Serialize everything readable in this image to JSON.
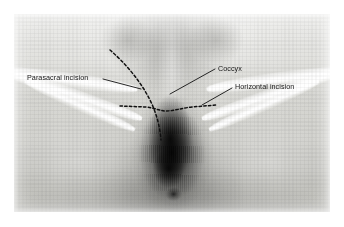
{
  "figure": {
    "type": "clinical-photograph",
    "modality": "grayscale photograph",
    "plate": {
      "left": 14,
      "top": 14,
      "width": 316,
      "height": 198,
      "background_color": "#c9c9c7"
    },
    "page_background": "#ffffff"
  },
  "annotations": {
    "labels": [
      {
        "id": "parasacral",
        "text": "Parasacral incision",
        "x": 27,
        "y": 74,
        "anchor": "left",
        "color": "#151515"
      },
      {
        "id": "coccyx",
        "text": "Coccyx",
        "x": 218,
        "y": 65,
        "anchor": "left",
        "color": "#151515"
      },
      {
        "id": "horizontal",
        "text": "Horizontal incision",
        "x": 235,
        "y": 83,
        "anchor": "left",
        "color": "#151515"
      }
    ],
    "leaders": [
      {
        "id": "leader-parasacral",
        "for": "parasacral",
        "from_x": 103,
        "from_y": 79,
        "to_x": 141,
        "to_y": 89,
        "color": "#111111",
        "width": 0.9
      },
      {
        "id": "leader-coccyx",
        "for": "coccyx",
        "from_x": 215,
        "from_y": 69,
        "to_x": 170,
        "to_y": 94,
        "color": "#111111",
        "width": 0.9
      },
      {
        "id": "leader-horizontal",
        "for": "horizontal",
        "from_x": 232,
        "from_y": 88,
        "to_x": 202,
        "to_y": 105,
        "color": "#111111",
        "width": 0.9
      }
    ],
    "incision_lines": [
      {
        "id": "parasacral-incision-line",
        "label": "Parasacral incision",
        "style": "dashed-curve",
        "color": "#101010",
        "width": 1.5,
        "dash": "2.6 2.4",
        "path": "M 110 50 C 124 62, 140 80, 150 100 C 157 114, 160 128, 161 140"
      },
      {
        "id": "horizontal-incision-line",
        "label": "Horizontal incision",
        "style": "dashed-line",
        "color": "#101010",
        "width": 1.5,
        "dash": "2.4 2.3",
        "path": "M 120 106 L 146 107 C 155 108, 160 111, 166 111 C 174 111, 182 108, 192 107 L 216 105"
      }
    ]
  }
}
